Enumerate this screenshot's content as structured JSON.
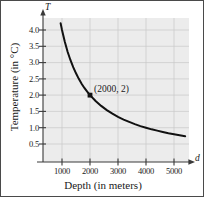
{
  "chart_data": {
    "type": "line",
    "title": "",
    "xlabel": "Depth (in meters)",
    "ylabel": "Temperature (in °C)",
    "x_axis_variable": "d",
    "y_axis_variable": "T",
    "xlim": [
      0,
      5700
    ],
    "ylim": [
      0,
      4.4
    ],
    "xticks": [
      1000,
      2000,
      3000,
      4000,
      5000
    ],
    "xtick_labels": [
      "1000",
      "2000",
      "3000",
      "4000",
      "5000"
    ],
    "yticks": [
      0.5,
      1.0,
      1.5,
      2.0,
      2.5,
      3.0,
      3.5,
      4.0
    ],
    "ytick_labels": [
      "0.5",
      "1.0",
      "1.5",
      "2.0",
      "2.5",
      "3.0",
      "3.5",
      "4.0"
    ],
    "grid": true,
    "legend": false,
    "curve_relation": "T = 4000 / d",
    "series": [
      {
        "name": "Temperature vs Depth",
        "x": [
          950,
          1000,
          1100,
          1200,
          1300,
          1400,
          1500,
          1600,
          1700,
          1800,
          1900,
          2000,
          2200,
          2400,
          2600,
          2800,
          3000,
          3200,
          3400,
          3600,
          3800,
          4000,
          4200,
          4400,
          4600,
          4800,
          5000,
          5200,
          5400
        ],
        "y": [
          4.21,
          4.0,
          3.64,
          3.33,
          3.08,
          2.86,
          2.67,
          2.5,
          2.35,
          2.22,
          2.11,
          2.0,
          1.82,
          1.67,
          1.54,
          1.43,
          1.33,
          1.25,
          1.18,
          1.11,
          1.05,
          1.0,
          0.95,
          0.91,
          0.87,
          0.83,
          0.8,
          0.77,
          0.74
        ]
      }
    ],
    "annotations": [
      {
        "label": "(2000, 2)",
        "x": 2000,
        "y": 2.0,
        "marker": true
      }
    ]
  }
}
